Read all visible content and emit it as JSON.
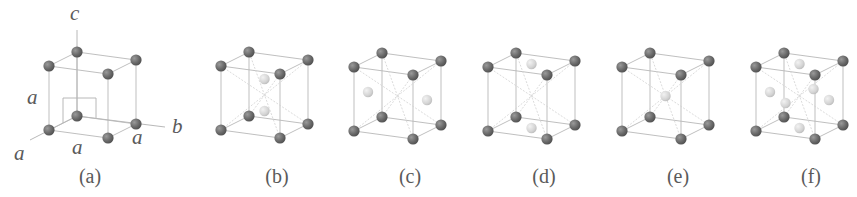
{
  "figure": {
    "colors": {
      "corner_atom": "#6e6e6e",
      "decorating_atom": "#d6d6d6",
      "edge": "#b8b8b8",
      "text": "#5a5a5a"
    },
    "axes": {
      "c_label": "c",
      "b_label": "b",
      "a_label": "a",
      "edge_labels": [
        "a",
        "a",
        "a"
      ]
    },
    "panels": [
      {
        "label": "(a)",
        "structure": "simple cubic",
        "decorations": []
      },
      {
        "label": "(b)",
        "structure": "body-diagonal pair",
        "decorations": [
          [
            0.5,
            0.5,
            0.25
          ],
          [
            0.5,
            0.5,
            0.75
          ]
        ]
      },
      {
        "label": "(c)",
        "structure": "side face centered",
        "decorations": [
          [
            0.0,
            0.5,
            0.5
          ],
          [
            1.0,
            0.5,
            0.5
          ]
        ]
      },
      {
        "label": "(d)",
        "structure": "base centered",
        "decorations": [
          [
            0.5,
            0.5,
            0.0
          ],
          [
            0.5,
            0.5,
            1.0
          ]
        ]
      },
      {
        "label": "(e)",
        "structure": "body centered",
        "decorations": [
          [
            0.5,
            0.5,
            0.5
          ]
        ]
      },
      {
        "label": "(f)",
        "structure": "face centered",
        "decorations": [
          [
            0.5,
            0.5,
            0.0
          ],
          [
            0.5,
            0.5,
            1.0
          ],
          [
            0.0,
            0.5,
            0.5
          ],
          [
            1.0,
            0.5,
            0.5
          ],
          [
            0.5,
            0.0,
            0.5
          ],
          [
            0.5,
            1.0,
            0.5
          ]
        ]
      }
    ]
  }
}
